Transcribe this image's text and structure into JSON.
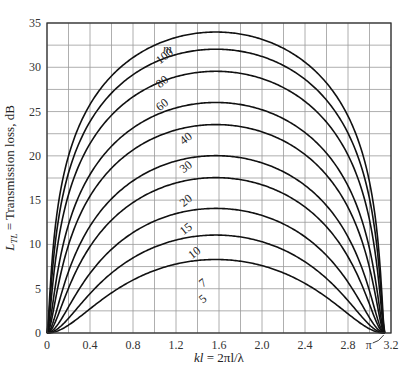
{
  "chart_data": {
    "type": "line",
    "title": "",
    "xlabel": "kl = 2πl/λ",
    "ylabel": "L_TL = Transmission loss, dB",
    "xlim": [
      0,
      3.2
    ],
    "ylim": [
      0,
      35
    ],
    "x_ticks": [
      "0",
      "0.4",
      "0.8",
      "1.2",
      "1.6",
      "2.0",
      "2.4",
      "2.8",
      "3.2"
    ],
    "x_tick_values": [
      0,
      0.4,
      0.8,
      1.2,
      1.6,
      2.0,
      2.4,
      2.8,
      3.2
    ],
    "y_ticks": [
      "0",
      "5",
      "10",
      "15",
      "20",
      "25",
      "30",
      "35"
    ],
    "y_tick_values": [
      0,
      5,
      10,
      15,
      20,
      25,
      30,
      35
    ],
    "grid": {
      "on": true,
      "x_step": 0.2,
      "y_step": 2.5
    },
    "annotation": {
      "text": "π",
      "x": 3.1416,
      "note": "all curves return to 0 at kl = π"
    },
    "legend_title": "m",
    "formula": "TL = 10·log10(1 + 0.25·(m − 1/m)²·sin²(kl))",
    "series": [
      {
        "name": "5",
        "m": 5,
        "peak_x": 1.571,
        "peak_y": 8.3
      },
      {
        "name": "7",
        "m": 7,
        "peak_x": 1.571,
        "peak_y": 11.1
      },
      {
        "name": "10",
        "m": 10,
        "peak_x": 1.571,
        "peak_y": 14.1
      },
      {
        "name": "15",
        "m": 15,
        "peak_x": 1.571,
        "peak_y": 17.5
      },
      {
        "name": "20",
        "m": 20,
        "peak_x": 1.571,
        "peak_y": 20.0
      },
      {
        "name": "30",
        "m": 30,
        "peak_x": 1.571,
        "peak_y": 23.5
      },
      {
        "name": "40",
        "m": 40,
        "peak_x": 1.571,
        "peak_y": 26.0
      },
      {
        "name": "60",
        "m": 60,
        "peak_x": 1.571,
        "peak_y": 29.5
      },
      {
        "name": "80",
        "m": 80,
        "peak_x": 1.571,
        "peak_y": 32.0
      },
      {
        "name": "100",
        "m": 100,
        "peak_x": 1.571,
        "peak_y": 34.0
      }
    ],
    "sample_x": [
      0,
      0.2,
      0.4,
      0.8,
      1.2,
      1.571,
      2.0,
      2.4,
      2.8,
      3.1416
    ],
    "sample_values": {
      "5": [
        0,
        1.0,
        2.8,
        5.6,
        7.4,
        8.3,
        7.6,
        6.0,
        3.4,
        0
      ],
      "7": [
        0,
        2.3,
        4.9,
        8.3,
        10.3,
        11.1,
        10.4,
        8.8,
        5.8,
        0
      ],
      "10": [
        0,
        4.2,
        7.5,
        11.3,
        13.3,
        14.1,
        13.5,
        11.8,
        8.7,
        0
      ],
      "15": [
        0,
        7.0,
        10.7,
        14.7,
        16.7,
        17.5,
        16.9,
        15.2,
        12.0,
        0
      ],
      "20": [
        0,
        9.2,
        13.1,
        17.2,
        19.2,
        20.0,
        19.4,
        17.7,
        14.5,
        0
      ],
      "30": [
        0,
        12.6,
        16.6,
        20.7,
        22.7,
        23.5,
        22.9,
        21.2,
        18.0,
        0
      ],
      "40": [
        0,
        15.0,
        19.1,
        23.2,
        25.2,
        26.0,
        25.4,
        23.7,
        20.5,
        0
      ],
      "60": [
        0,
        18.5,
        22.6,
        26.7,
        28.7,
        29.5,
        28.9,
        27.2,
        24.0,
        0
      ],
      "80": [
        0,
        21.0,
        25.1,
        29.2,
        31.2,
        32.0,
        31.4,
        29.7,
        26.5,
        0
      ],
      "100": [
        0,
        23.0,
        27.1,
        31.2,
        33.2,
        34.0,
        33.4,
        31.7,
        28.5,
        0
      ]
    },
    "label_positions": {
      "m": [
        1.08,
        31.6
      ],
      "100": [
        1.05,
        30.3
      ],
      "80": [
        1.05,
        27.6
      ],
      "60": [
        1.05,
        25.0
      ],
      "40": [
        1.27,
        21.2
      ],
      "30": [
        1.27,
        18.0
      ],
      "20": [
        1.27,
        14.2
      ],
      "15": [
        1.27,
        11.0
      ],
      "10": [
        1.35,
        8.3
      ],
      "7": [
        1.45,
        5.1
      ],
      "5": [
        1.45,
        3.3
      ]
    }
  },
  "colors": {
    "curve": "#111111",
    "grid": "#9a9a9a",
    "frame": "#333333",
    "text": "#222222"
  }
}
